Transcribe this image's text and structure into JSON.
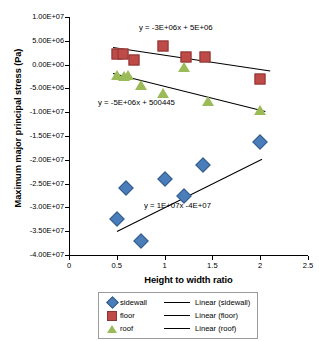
{
  "chart_data": {
    "type": "scatter",
    "title": "",
    "xlabel": "Height to width ratio",
    "ylabel": "Maximum major principal stress (Pa)",
    "xlim": [
      0,
      2.5
    ],
    "ylim": [
      -40000000,
      10000000
    ],
    "xticks": [
      "0",
      "0.5",
      "1",
      "1.5",
      "2",
      "2.5"
    ],
    "xtick_values": [
      0,
      0.5,
      1,
      1.5,
      2,
      2.5
    ],
    "yticks": [
      "1.00E+07",
      "5.00E+06",
      "0.00E+00",
      "-5.00E+06",
      "-1.00E+07",
      "-1.50E+07",
      "-2.00E+07",
      "-2.50E+07",
      "-3.00E+07",
      "-3.50E+07",
      "-4.00E+07"
    ],
    "ytick_values": [
      10000000,
      5000000,
      0,
      -5000000,
      -10000000,
      -15000000,
      -20000000,
      -25000000,
      -30000000,
      -35000000,
      -40000000
    ],
    "grid": false,
    "legend_position": "bottom",
    "series": [
      {
        "name": "sidewall",
        "marker": "diamond",
        "color": "#4A7EBB",
        "points": [
          {
            "x": 0.5,
            "y": -32500000
          },
          {
            "x": 0.6,
            "y": -26000000
          },
          {
            "x": 0.75,
            "y": -37100000
          },
          {
            "x": 1.0,
            "y": -24000000
          },
          {
            "x": 1.2,
            "y": -27500000
          },
          {
            "x": 1.4,
            "y": -21000000
          },
          {
            "x": 2.0,
            "y": -16200000
          }
        ],
        "trendline": {
          "label": "Linear (sidewall)",
          "equation": "y = 1E+07x -4E+07",
          "slope": 10000000,
          "intercept": -40000000,
          "x_start": 0.5,
          "x_end": 2.02
        }
      },
      {
        "name": "floor",
        "marker": "square",
        "color": "#BE4B48",
        "points": [
          {
            "x": 0.5,
            "y": 2300000
          },
          {
            "x": 0.57,
            "y": 2200000
          },
          {
            "x": 0.68,
            "y": 1000000
          },
          {
            "x": 0.98,
            "y": 3900000
          },
          {
            "x": 1.22,
            "y": 1700000
          },
          {
            "x": 1.42,
            "y": 1700000
          },
          {
            "x": 2.0,
            "y": -3000000
          }
        ],
        "trendline": {
          "label": "Linear (floor)",
          "equation": "y = -3E+06x + 5E+06",
          "slope": -3000000,
          "intercept": 5000000,
          "x_start": 0.46,
          "x_end": 2.1
        }
      },
      {
        "name": "roof",
        "marker": "triangle",
        "color": "#9BBB59",
        "points": [
          {
            "x": 0.5,
            "y": -2100000
          },
          {
            "x": 0.58,
            "y": -2300000
          },
          {
            "x": 0.62,
            "y": -2100000
          },
          {
            "x": 0.75,
            "y": -4200000
          },
          {
            "x": 0.98,
            "y": -5900000
          },
          {
            "x": 1.2,
            "y": -500000
          },
          {
            "x": 1.45,
            "y": -7600000
          },
          {
            "x": 2.0,
            "y": -9500000
          }
        ],
        "trendline": {
          "label": "Linear (roof)",
          "equation": "y = -5E+06x + 500445",
          "slope": -5000000,
          "intercept": 500445,
          "x_start": 0.46,
          "x_end": 2.05
        }
      }
    ],
    "annotations": [
      {
        "text": "y = -3E+06x + 5E+06",
        "series": "floor",
        "x_px": 139,
        "y_px": 23
      },
      {
        "text": "y = -5E+06x + 500445",
        "series": "roof",
        "x_px": 98,
        "y_px": 98
      },
      {
        "text": "y = 1E+07x -4E+07",
        "series": "sidewall",
        "x_px": 144,
        "y_px": 201
      }
    ],
    "legend": [
      {
        "label": "sidewall",
        "line_label": "Linear (sidewall)",
        "marker": "diamond",
        "color": "#4A7EBB"
      },
      {
        "label": "floor",
        "line_label": "Linear (floor)",
        "marker": "square",
        "color": "#BE4B48"
      },
      {
        "label": "roof",
        "line_label": "Linear (roof)",
        "marker": "triangle",
        "color": "#9BBB59"
      }
    ]
  }
}
